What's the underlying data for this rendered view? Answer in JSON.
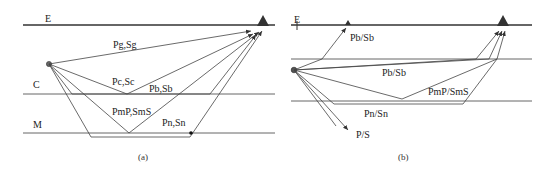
{
  "panels": [
    {
      "id": "a",
      "caption": "(a)",
      "layers": {
        "surface_label": "E",
        "crust_label": "C",
        "moho_label": "M"
      },
      "phases": {
        "direct": "Pg,Sg",
        "conrad_reflection": "Pc,Sc",
        "conrad_refraction": "Pb,Sb",
        "moho_reflection": "PmP,SmS",
        "moho_refraction": "Pn,Sn"
      }
    },
    {
      "id": "b",
      "caption": "(b)",
      "layers": {
        "surface_label": "E"
      },
      "phases": {
        "upgoing": "Pb/Sb",
        "conrad_refraction": "Pb/Sb",
        "moho_reflection": "PmP/SmS",
        "moho_refraction": "Pn/Sn",
        "downgoing": "P/S"
      }
    }
  ],
  "colors": {
    "line": "#444444",
    "station": "#333333",
    "background": "#ffffff"
  }
}
